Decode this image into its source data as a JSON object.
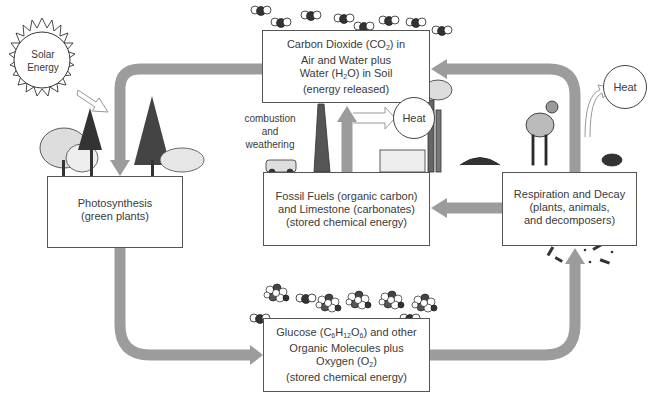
{
  "diagram": {
    "type": "carbon-cycle",
    "colors": {
      "flow_arrow": "#9c9c9c",
      "box_border": "#555555",
      "text": "#3a3a3a",
      "background": "#ffffff"
    },
    "sun": {
      "lines": [
        "Solar",
        "Energy"
      ]
    },
    "nodes": {
      "co2": {
        "line1_pre": "Carbon Dioxide (CO",
        "line1_sub": "2",
        "line1_post": ") in",
        "line2": "Air and Water plus",
        "line3_pre": "Water (H",
        "line3_sub": "2",
        "line3_post": "O) in Soil",
        "line4": "(energy released)"
      },
      "photosynthesis": {
        "line1": "Photosynthesis",
        "line2": "(green plants)"
      },
      "fossil_fuels": {
        "line1": "Fossil Fuels (organic carbon)",
        "line2": "and Limestone (carbonates)",
        "line3": "(stored chemical energy)"
      },
      "respiration": {
        "line1": "Respiration and Decay",
        "line2": "(plants, animals,",
        "line3": "and decomposers)"
      },
      "glucose": {
        "line1_pre": "Glucose (C",
        "line1_sub1": "6",
        "line1_mid1": "H",
        "line1_sub2": "12",
        "line1_mid2": "O",
        "line1_sub3": "6",
        "line1_post": ") and other",
        "line2": "Organic Molecules plus",
        "line3_pre": "Oxygen (O",
        "line3_sub": "2",
        "line3_post": ")",
        "line4": "(stored chemical energy)"
      }
    },
    "heat_nodes": [
      {
        "id": "heat-combustion",
        "label": "Heat"
      },
      {
        "id": "heat-respiration",
        "label": "Heat"
      }
    ],
    "edge_labels": {
      "combustion": [
        "combustion",
        "and",
        "weathering"
      ]
    },
    "edges": [
      {
        "from": "co2",
        "to": "photosynthesis"
      },
      {
        "from": "photosynthesis",
        "to": "glucose"
      },
      {
        "from": "glucose",
        "to": "respiration"
      },
      {
        "from": "respiration",
        "to": "co2"
      },
      {
        "from": "respiration",
        "to": "fossil_fuels"
      },
      {
        "from": "fossil_fuels",
        "to": "co2",
        "label": "combustion and weathering"
      },
      {
        "from": "fossil_fuels",
        "to": "heat-combustion"
      },
      {
        "from": "respiration",
        "to": "heat-respiration"
      },
      {
        "from": "sun",
        "to": "photosynthesis"
      }
    ]
  }
}
